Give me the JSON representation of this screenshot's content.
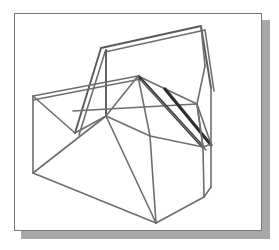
{
  "figure": {
    "kind": "wireframe-isometric-solid",
    "frame": {
      "border_color": "#787878",
      "background_color": "#ffffff",
      "shadow_color": "#a8a8a8",
      "x": 14,
      "y": 13,
      "width": 248,
      "height": 218,
      "shadow_offset_x": 7,
      "shadow_offset_y": 7
    },
    "stroke_colors": {
      "thin": "#6e6e6e",
      "medium": "#5a5a5a",
      "bold": "#2e2e2e"
    },
    "vertices": {
      "top_right_apex": [
        186,
        12
      ],
      "top_right_apex_b": [
        190,
        14
      ],
      "upper_left_apex": [
        86,
        34
      ],
      "upper_left_apex_b": [
        90,
        36
      ],
      "left_upper": [
        18,
        82
      ],
      "left_mid": [
        18,
        113
      ],
      "left_bottom": [
        18,
        159
      ],
      "ridge_center": [
        123,
        62
      ],
      "ridge_center_b": [
        126,
        64
      ],
      "hub_node": [
        91,
        102
      ],
      "mid_node": [
        58,
        97
      ],
      "fold_low": [
        60,
        119
      ],
      "right_wing_top": [
        190,
        52
      ],
      "right_wing_mid": [
        196,
        74
      ],
      "right_edge_upper": [
        182,
        90
      ],
      "right_node": [
        188,
        133
      ],
      "right_node_b": [
        196,
        130
      ],
      "right_lower": [
        196,
        173
      ],
      "bottom_apex": [
        141,
        209
      ],
      "bottom_right": [
        189,
        183
      ],
      "inner_vertical_top": [
        135,
        122
      ],
      "inner_vertical_bot": [
        141,
        209
      ],
      "slab_upper": [
        118,
        98
      ],
      "slab_lower": [
        151,
        145
      ]
    },
    "edges": [
      {
        "name": "top-ridge-outer",
        "weight": "medium",
        "points": [
          [
            86,
            34
          ],
          [
            186,
            12
          ]
        ]
      },
      {
        "name": "top-ridge-inner",
        "weight": "thin",
        "points": [
          [
            90,
            38
          ],
          [
            190,
            16
          ]
        ]
      },
      {
        "name": "left-gable-outer",
        "weight": "medium",
        "points": [
          [
            86,
            34
          ],
          [
            60,
            119
          ]
        ]
      },
      {
        "name": "left-gable-inner",
        "weight": "thin",
        "points": [
          [
            90,
            38
          ],
          [
            64,
            121
          ]
        ]
      },
      {
        "name": "apex-vertical",
        "weight": "medium",
        "points": [
          [
            91,
            36
          ],
          [
            91,
            102
          ]
        ]
      },
      {
        "name": "right-gable-outer",
        "weight": "medium",
        "points": [
          [
            186,
            12
          ],
          [
            196,
            74
          ]
        ]
      },
      {
        "name": "right-gable-inner",
        "weight": "thin",
        "points": [
          [
            190,
            16
          ],
          [
            199,
            77
          ]
        ]
      },
      {
        "name": "right-wing-fold",
        "weight": "thin",
        "points": [
          [
            186,
            12
          ],
          [
            190,
            52
          ]
        ]
      },
      {
        "name": "right-wing-lower",
        "weight": "thin",
        "points": [
          [
            190,
            52
          ],
          [
            182,
            90
          ]
        ]
      },
      {
        "name": "left-long-edge",
        "weight": "thin",
        "points": [
          [
            18,
            82
          ],
          [
            123,
            62
          ]
        ]
      },
      {
        "name": "left-long-edge-b",
        "weight": "thin",
        "points": [
          [
            18,
            86
          ],
          [
            126,
            65
          ]
        ]
      },
      {
        "name": "left-vertical",
        "weight": "thin",
        "points": [
          [
            18,
            82
          ],
          [
            18,
            159
          ]
        ]
      },
      {
        "name": "left-fold-top",
        "weight": "thin",
        "points": [
          [
            18,
            82
          ],
          [
            60,
            119
          ]
        ]
      },
      {
        "name": "left-fold-bot",
        "weight": "thin",
        "points": [
          [
            18,
            159
          ],
          [
            91,
            102
          ]
        ]
      },
      {
        "name": "left-bottom-run",
        "weight": "thin",
        "points": [
          [
            18,
            159
          ],
          [
            141,
            209
          ]
        ]
      },
      {
        "name": "hub-to-fold",
        "weight": "thin",
        "points": [
          [
            60,
            119
          ],
          [
            91,
            102
          ]
        ]
      },
      {
        "name": "hub-to-ridge",
        "weight": "thin",
        "points": [
          [
            91,
            102
          ],
          [
            123,
            62
          ]
        ]
      },
      {
        "name": "ridge-to-right-edge",
        "weight": "thin",
        "points": [
          [
            123,
            62
          ],
          [
            182,
            90
          ]
        ]
      },
      {
        "name": "mid-horizontal",
        "weight": "thin",
        "points": [
          [
            58,
            97
          ],
          [
            182,
            90
          ]
        ]
      },
      {
        "name": "slab-bold-left",
        "weight": "bold",
        "points": [
          [
            124,
            63
          ],
          [
            188,
            133
          ]
        ]
      },
      {
        "name": "slab-bold-right",
        "weight": "bold",
        "points": [
          [
            150,
            75
          ],
          [
            196,
            131
          ]
        ]
      },
      {
        "name": "slab-thin-inner",
        "weight": "thin",
        "points": [
          [
            126,
            66
          ],
          [
            191,
            136
          ]
        ]
      },
      {
        "name": "hub-diagonal-down",
        "weight": "thin",
        "points": [
          [
            91,
            102
          ],
          [
            135,
            122
          ]
        ]
      },
      {
        "name": "ridge-down-left",
        "weight": "thin",
        "points": [
          [
            123,
            62
          ],
          [
            135,
            122
          ]
        ]
      },
      {
        "name": "inner-vertical",
        "weight": "thin",
        "points": [
          [
            135,
            122
          ],
          [
            141,
            209
          ]
        ]
      },
      {
        "name": "body-left-slope",
        "weight": "thin",
        "points": [
          [
            91,
            102
          ],
          [
            141,
            209
          ]
        ]
      },
      {
        "name": "body-top-right",
        "weight": "thin",
        "points": [
          [
            135,
            122
          ],
          [
            188,
            133
          ]
        ]
      },
      {
        "name": "body-bottom-right",
        "weight": "thin",
        "points": [
          [
            141,
            209
          ],
          [
            189,
            183
          ]
        ]
      },
      {
        "name": "right-body-vertical",
        "weight": "thin",
        "points": [
          [
            188,
            133
          ],
          [
            189,
            183
          ]
        ]
      },
      {
        "name": "right-outer-vertical",
        "weight": "thin",
        "points": [
          [
            196,
            130
          ],
          [
            196,
            173
          ]
        ]
      },
      {
        "name": "right-bottom-fold",
        "weight": "thin",
        "points": [
          [
            189,
            183
          ],
          [
            196,
            173
          ]
        ]
      },
      {
        "name": "right-node-link",
        "weight": "thin",
        "points": [
          [
            188,
            133
          ],
          [
            196,
            130
          ]
        ]
      },
      {
        "name": "right-edge-to-node",
        "weight": "thin",
        "points": [
          [
            182,
            90
          ],
          [
            188,
            133
          ]
        ]
      },
      {
        "name": "right-wing-to-node",
        "weight": "thin",
        "points": [
          [
            196,
            74
          ],
          [
            196,
            130
          ]
        ]
      },
      {
        "name": "right-splay-a",
        "weight": "thin",
        "points": [
          [
            182,
            90
          ],
          [
            196,
            130
          ]
        ]
      },
      {
        "name": "right-splay-b",
        "weight": "thin",
        "points": [
          [
            188,
            133
          ],
          [
            182,
            90
          ]
        ]
      }
    ]
  }
}
